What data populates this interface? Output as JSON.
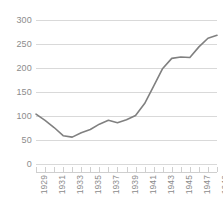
{
  "chart_data": {
    "type": "line",
    "title": "",
    "subtitle": "",
    "xlabel": "",
    "ylabel": "",
    "x": [
      1929,
      1930,
      1931,
      1932,
      1933,
      1934,
      1935,
      1936,
      1937,
      1938,
      1939,
      1940,
      1941,
      1942,
      1943,
      1944,
      1945,
      1946,
      1947,
      1948,
      1949
    ],
    "series": [
      {
        "name": "GNP",
        "color": "#808080",
        "values": [
          104,
          91,
          76,
          59,
          56,
          65,
          72,
          83,
          91,
          86,
          92,
          101,
          126,
          162,
          199,
          220,
          223,
          222,
          244,
          262,
          268
        ]
      }
    ],
    "xlim": [
      1929,
      1949
    ],
    "ylim": [
      0,
      300
    ],
    "ytick_labels": [
      "300",
      "250",
      "200",
      "150",
      "100",
      "50",
      "0"
    ],
    "ytick_values": [
      300,
      250,
      200,
      150,
      100,
      50,
      0
    ],
    "xtick_labels": [
      "1929",
      "1931",
      "1933",
      "1935",
      "1937",
      "1939",
      "1941",
      "1943",
      "1945",
      "1947",
      "1949"
    ],
    "xtick_values": [
      1929,
      1931,
      1933,
      1935,
      1937,
      1939,
      1941,
      1943,
      1945,
      1947,
      1949
    ],
    "xtick_minor_values": [
      1929,
      1930,
      1931,
      1932,
      1933,
      1934,
      1935,
      1936,
      1937,
      1938,
      1939,
      1940,
      1941,
      1942,
      1943,
      1944,
      1945,
      1946,
      1947,
      1948,
      1949
    ],
    "grid": {
      "horizontal": true,
      "vertical": false,
      "color": "#d9d9d9"
    },
    "legend": {
      "visible": false,
      "position": "none"
    },
    "axis_label_color": "#8c8c8c",
    "background_color": "#ffffff"
  }
}
